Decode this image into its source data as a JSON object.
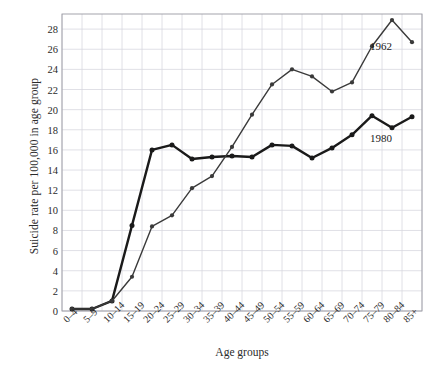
{
  "chart_data": {
    "type": "line",
    "title": "",
    "xlabel": "Age groups",
    "ylabel": "Suicide rate per 100,000 in age group",
    "categories": [
      "0–4",
      "5–9",
      "10–14",
      "15–19",
      "20–24",
      "25–29",
      "30–34",
      "35–39",
      "40–44",
      "45–49",
      "50–54",
      "55–59",
      "60–64",
      "65–69",
      "70–74",
      "75–79",
      "80–84",
      "85+"
    ],
    "ylim": [
      0,
      29.5
    ],
    "yticks": [
      0,
      2,
      4,
      6,
      8,
      10,
      12,
      14,
      16,
      18,
      20,
      22,
      24,
      26,
      28
    ],
    "ytick_labels": [
      "0",
      "2",
      "4",
      "6",
      "8",
      "10",
      "12",
      "14",
      "16",
      "18",
      "20",
      "22",
      "24",
      "26",
      "28"
    ],
    "grid": true,
    "legend_position": "inline-annotation",
    "series": [
      {
        "name": "1980",
        "color": "#1a1a1a",
        "line_width": 2.4,
        "marker": "circle",
        "values": [
          0.2,
          0.2,
          1.0,
          8.5,
          16.0,
          16.5,
          15.1,
          15.3,
          15.4,
          15.3,
          16.5,
          16.4,
          15.2,
          16.2,
          17.5,
          19.4,
          18.2,
          19.3
        ]
      },
      {
        "name": "1962",
        "color": "#3a3a3a",
        "line_width": 1.4,
        "marker": "circle",
        "values": [
          0.2,
          0.2,
          1.0,
          3.4,
          8.4,
          9.5,
          12.2,
          13.4,
          16.3,
          19.5,
          22.5,
          24.0,
          23.3,
          21.8,
          22.7,
          26.3,
          28.9,
          26.7
        ]
      }
    ],
    "annotations": [
      {
        "text": "1962",
        "x_category": "80–84",
        "y_value": 26.2
      },
      {
        "text": "1980",
        "x_category": "80–84",
        "y_value": 17.1
      }
    ]
  },
  "colors": {
    "grid": "#d8d8e0",
    "axis": "#9a9aa2",
    "text": "#2b2b2b",
    "series_1980": "#1a1a1a",
    "series_1962": "#3a3a3a",
    "background": "#ffffff"
  }
}
